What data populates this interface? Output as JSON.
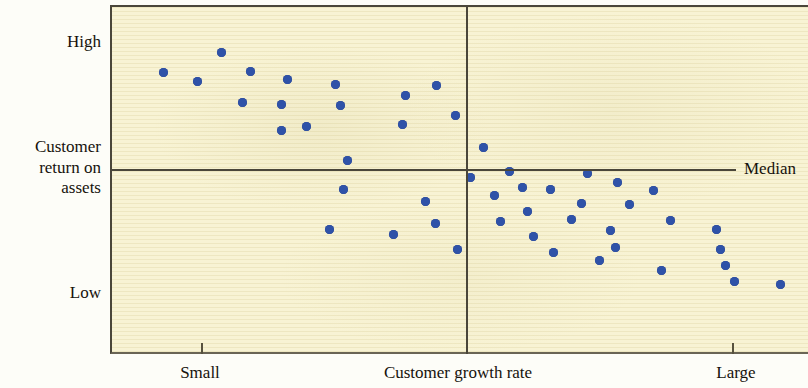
{
  "figure": {
    "axis_y_title_lines": [
      "Customer",
      "return on",
      "assets"
    ],
    "y_high_label": "High",
    "y_low_label": "Low",
    "x_title": "Customer growth rate",
    "x_small_label": "Small",
    "x_large_label": "Large",
    "median_label": "Median",
    "point_color": "#2f52a8",
    "background_color": "#f8f3d4",
    "axis_color": "#4a463a"
  },
  "chart_data": {
    "type": "scatter",
    "title": "",
    "xlabel": "Customer growth rate",
    "ylabel": "Customer return on assets",
    "xlim": [
      0,
      100
    ],
    "ylim": [
      0,
      100
    ],
    "grid": false,
    "legend": null,
    "x_tick_labels": [
      "Small",
      "Large"
    ],
    "x_tick_positions": [
      13,
      89
    ],
    "y_tick_labels": [
      "High",
      "Low"
    ],
    "annotations": [
      {
        "text": "Median",
        "type": "reference-line-label",
        "axis": "y",
        "value": 53
      }
    ],
    "reference_lines": [
      {
        "orientation": "vertical",
        "x": 51,
        "label": ""
      },
      {
        "orientation": "horizontal",
        "y": 53,
        "label": "Median"
      }
    ],
    "points": [
      {
        "x": 7.4,
        "y": 81.0
      },
      {
        "x": 12.3,
        "y": 78.6
      },
      {
        "x": 15.7,
        "y": 86.8
      },
      {
        "x": 19.9,
        "y": 81.3
      },
      {
        "x": 18.7,
        "y": 72.4
      },
      {
        "x": 25.2,
        "y": 79.0
      },
      {
        "x": 24.3,
        "y": 71.8
      },
      {
        "x": 24.3,
        "y": 64.3
      },
      {
        "x": 32.1,
        "y": 77.6
      },
      {
        "x": 32.8,
        "y": 71.6
      },
      {
        "x": 27.9,
        "y": 65.5
      },
      {
        "x": 33.8,
        "y": 55.8
      },
      {
        "x": 42.2,
        "y": 74.5
      },
      {
        "x": 46.6,
        "y": 77.3
      },
      {
        "x": 41.7,
        "y": 66.1
      },
      {
        "x": 49.4,
        "y": 68.8
      },
      {
        "x": 33.3,
        "y": 47.5
      },
      {
        "x": 31.3,
        "y": 35.8
      },
      {
        "x": 40.5,
        "y": 34.4
      },
      {
        "x": 45.1,
        "y": 44.0
      },
      {
        "x": 46.5,
        "y": 37.5
      },
      {
        "x": 49.6,
        "y": 30.0
      },
      {
        "x": 53.4,
        "y": 59.4
      },
      {
        "x": 51.5,
        "y": 50.8
      },
      {
        "x": 57.1,
        "y": 52.6
      },
      {
        "x": 59.0,
        "y": 48.1
      },
      {
        "x": 54.9,
        "y": 45.8
      },
      {
        "x": 55.8,
        "y": 38.2
      },
      {
        "x": 59.7,
        "y": 41.2
      },
      {
        "x": 63.0,
        "y": 47.3
      },
      {
        "x": 60.5,
        "y": 33.8
      },
      {
        "x": 63.5,
        "y": 29.3
      },
      {
        "x": 68.3,
        "y": 52.1
      },
      {
        "x": 67.4,
        "y": 43.5
      },
      {
        "x": 66.0,
        "y": 38.9
      },
      {
        "x": 70.1,
        "y": 27.0
      },
      {
        "x": 72.6,
        "y": 49.5
      },
      {
        "x": 74.3,
        "y": 43.2
      },
      {
        "x": 71.6,
        "y": 35.6
      },
      {
        "x": 72.3,
        "y": 30.7
      },
      {
        "x": 77.8,
        "y": 47.0
      },
      {
        "x": 80.2,
        "y": 38.5
      },
      {
        "x": 78.9,
        "y": 24.1
      },
      {
        "x": 86.8,
        "y": 36.0
      },
      {
        "x": 87.4,
        "y": 30.0
      },
      {
        "x": 88.2,
        "y": 25.5
      },
      {
        "x": 89.5,
        "y": 21.0
      },
      {
        "x": 96.0,
        "y": 20.0
      }
    ]
  }
}
